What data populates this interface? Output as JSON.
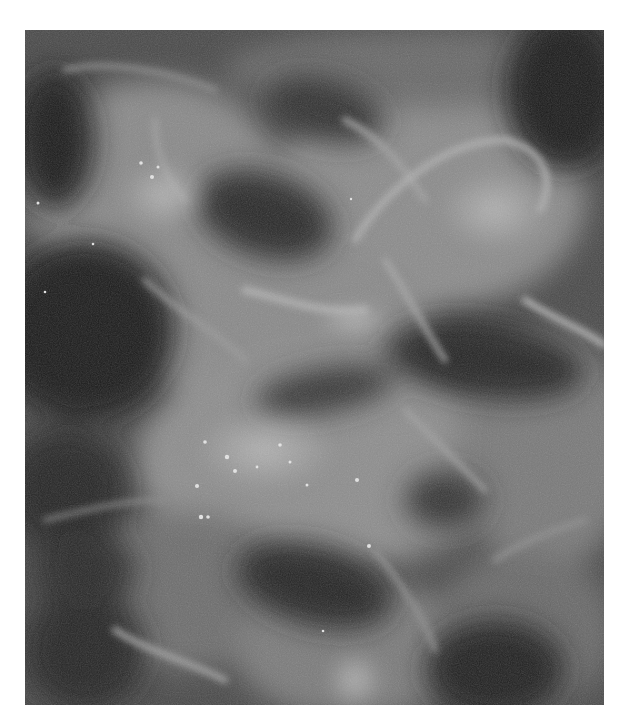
{
  "figure": {
    "type": "grayscale fluorescence micrograph",
    "bounds": {
      "x": 25,
      "y": 30,
      "width": 579,
      "height": 675
    },
    "colors": {
      "background": "#ffffff",
      "dark_region": "#1e1e1e",
      "mid_gray": "#6e6e6e",
      "bright_region": "#c8c8c8"
    },
    "labels": [],
    "scale_bar": null
  }
}
